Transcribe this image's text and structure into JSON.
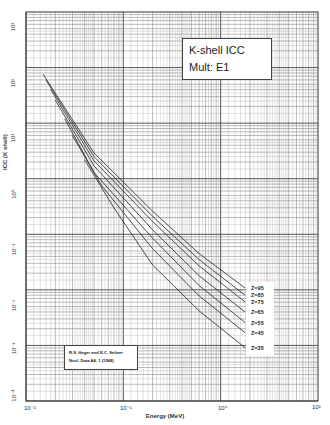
{
  "chart_data": {
    "type": "line",
    "title": "K-shell ICC",
    "subtitle": "Mult: E1",
    "xlabel": "Energy (MeV)",
    "ylabel": "ICC (K shell)",
    "xscale": "log",
    "yscale": "log",
    "xlim": [
      0.01,
      10
    ],
    "ylim": [
      0.0001,
      1000
    ],
    "grid": true,
    "x_ticks": [
      "10^-2",
      "10^-1",
      "10^0",
      "10^1"
    ],
    "y_ticks": [
      "10^-4",
      "10^-3",
      "10^-2",
      "10^-1",
      "10^0",
      "10^1",
      "10^2",
      "10^3"
    ],
    "annotation": [
      "R.S. Hager and E.C. Seltzer",
      "Nucl. Data A4, 1 (1968)"
    ],
    "series": [
      {
        "name": "Z=95",
        "x": [
          0.015,
          0.05,
          0.2,
          0.6,
          1.78
        ],
        "y": [
          76,
          2.9,
          0.26,
          0.045,
          0.0108
        ]
      },
      {
        "name": "Z=85",
        "x": [
          0.016,
          0.05,
          0.2,
          0.6,
          1.78
        ],
        "y": [
          60,
          2.5,
          0.21,
          0.035,
          0.008
        ]
      },
      {
        "name": "Z=75",
        "x": [
          0.018,
          0.05,
          0.2,
          0.6,
          1.78
        ],
        "y": [
          40,
          2.1,
          0.17,
          0.027,
          0.0061
        ]
      },
      {
        "name": "Z=65",
        "x": [
          0.02,
          0.05,
          0.2,
          0.6,
          1.78
        ],
        "y": [
          26,
          1.7,
          0.12,
          0.018,
          0.004
        ]
      },
      {
        "name": "Z=55",
        "x": [
          0.025,
          0.05,
          0.2,
          0.6,
          1.78
        ],
        "y": [
          12,
          1.3,
          0.085,
          0.012,
          0.0026
        ]
      },
      {
        "name": "Z=45",
        "x": [
          0.03,
          0.06,
          0.2,
          0.6,
          1.78
        ],
        "y": [
          6,
          0.75,
          0.055,
          0.0078,
          0.0017
        ]
      },
      {
        "name": "Z=35",
        "x": [
          0.04,
          0.08,
          0.2,
          0.6,
          1.78
        ],
        "y": [
          2.2,
          0.3,
          0.028,
          0.0042,
          0.00091
        ]
      }
    ],
    "legend_position": "right-inline"
  },
  "labels": {
    "title": "K-shell ICC",
    "subtitle": "Mult: E1",
    "xlabel": "Energy (MeV)",
    "ylabel": "ICC (K shell)",
    "ref_line1": "R.S. Hager and E.C. Seltzer",
    "ref_line2": "Nucl. Data A4, 1 (1968)",
    "x_ticks": [
      "10⁻²",
      "10⁻¹",
      "10⁰",
      "10¹"
    ],
    "y_ticks": [
      "10³",
      "10²",
      "10¹",
      "10⁰",
      "10⁻¹",
      "10⁻²",
      "10⁻³",
      "10⁻⁴"
    ],
    "z": [
      "Z=95",
      "Z=85",
      "Z=75",
      "Z=65",
      "Z=55",
      "Z=45",
      "Z=35"
    ]
  }
}
